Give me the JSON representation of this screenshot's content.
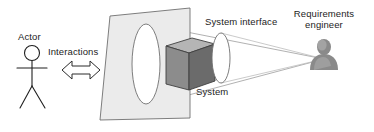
{
  "diagram": {
    "type": "conceptual-diagram",
    "background_color": "#ffffff",
    "labels": {
      "actor": "Actor",
      "interactions": "Interactions",
      "system_interface": "System interface",
      "system": "System",
      "requirements_engineer_line1": "Requirements",
      "requirements_engineer_line2": "engineer"
    },
    "colors": {
      "plane_fill": "#ebebeb",
      "plane_stroke": "#6f6f6f",
      "cube_top": "#b5b5b5",
      "cube_left": "#8c8c8c",
      "cube_right": "#6b6b6b",
      "cube_stroke": "#3f3f3f",
      "ellipse_stroke": "#6f6f6f",
      "cone_stroke": "#9a9a9a",
      "arrow_stroke": "#2b2b2b",
      "figure_stroke": "#1f1f1f",
      "avatar_fill": "#8f8f8f",
      "text": "#1c1c1c"
    },
    "shapes": {
      "actor_stick_figure": "stick-figure",
      "interactions_arrow": "double-headed-block-arrow",
      "plane": "tilted-quadrilateral",
      "system_cube": "3d-cube",
      "near_ellipse": "vertical-ellipse",
      "interface_ellipse": "vertical-ellipse",
      "view_cone": "projection-cone",
      "requirements_engineer_avatar": "person-bust"
    }
  }
}
